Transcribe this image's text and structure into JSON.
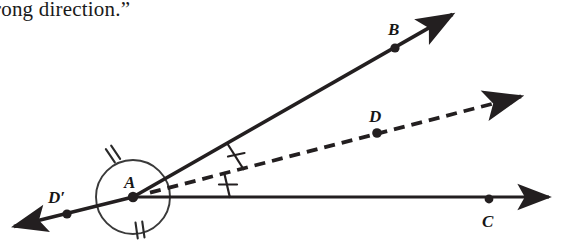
{
  "page": {
    "width": 565,
    "height": 244,
    "background": "#ffffff",
    "ink_color": "#231f20"
  },
  "caption": {
    "text": "rong direction.”"
  },
  "diagram": {
    "type": "geometry-angle-bisector",
    "vertex": {
      "name": "A",
      "label": "A",
      "x": 133,
      "y": 197,
      "label_x": 124,
      "label_y": 188
    },
    "points": [
      {
        "name": "B",
        "label": "B",
        "x": 395,
        "y": 48,
        "label_x": 388,
        "label_y": 34,
        "on": "ray-ab"
      },
      {
        "name": "D",
        "label": "D",
        "x": 377,
        "y": 133,
        "label_x": 370,
        "label_y": 120,
        "on": "ray-ad-dashed"
      },
      {
        "name": "C",
        "label": "C",
        "x": 489,
        "y": 200,
        "label_x": 483,
        "label_y": 225,
        "on": "ray-ac"
      },
      {
        "name": "Dp",
        "label": "D′",
        "x": 67,
        "y": 214,
        "label_x": 50,
        "label_y": 202,
        "on": "ray-adprime"
      }
    ],
    "rays": [
      {
        "name": "ray-ab",
        "label": "AB",
        "style": "solid",
        "from_x": 133,
        "from_y": 197,
        "to_x": 458,
        "to_y": 11,
        "arrow": true
      },
      {
        "name": "ray-ad-dashed",
        "label": "AD",
        "style": "dashed",
        "from_x": 133,
        "from_y": 197,
        "to_x": 530,
        "to_y": 94,
        "arrow": true
      },
      {
        "name": "ray-ac",
        "label": "AC",
        "style": "solid",
        "from_x": 133,
        "from_y": 197,
        "to_x": 556,
        "to_y": 197,
        "arrow": true
      },
      {
        "name": "ray-adprime",
        "label": "AD′",
        "style": "solid",
        "from_x": 133,
        "from_y": 197,
        "to_x": 8,
        "to_y": 228,
        "arrow": true
      }
    ],
    "angle_arcs": [
      {
        "name": "arc-bad",
        "label": "angle BAD",
        "ticks": 1,
        "tick_x": 236,
        "tick_y": 158
      },
      {
        "name": "arc-dac",
        "label": "angle DAC",
        "ticks": 1,
        "tick_x": 228,
        "tick_y": 186
      }
    ],
    "vertex_circle": {
      "name": "full-circle-around-A",
      "center_x": 133,
      "center_y": 197,
      "radius": 37,
      "ticks": [
        {
          "name": "double-tick-upper-left",
          "count": 2,
          "x": 113,
          "y": 154,
          "rotate": -34
        },
        {
          "name": "double-tick-bottom",
          "count": 2,
          "x": 140,
          "y": 230,
          "rotate": -8
        }
      ]
    }
  }
}
